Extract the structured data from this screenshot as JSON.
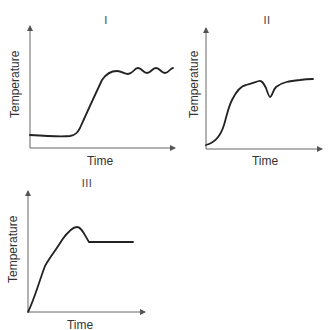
{
  "figure": {
    "panels": [
      {
        "id": "I",
        "label": "I",
        "xlabel": "Time",
        "ylabel": "Temperature",
        "curve_description": "flat low baseline, steep rise, then oscillating plateau"
      },
      {
        "id": "II",
        "label": "II",
        "xlabel": "Time",
        "ylabel": "Temperature",
        "curve_description": "S-shaped rise, plateau, sharp dip, then recovery to slightly higher plateau"
      },
      {
        "id": "III",
        "label": "III",
        "xlabel": "Time",
        "ylabel": "Temperature",
        "curve_description": "steady rise to a peak (overshoot), drop, then flat constant plateau"
      }
    ],
    "colors": {
      "line": "#222222",
      "axis": "#555555"
    }
  }
}
